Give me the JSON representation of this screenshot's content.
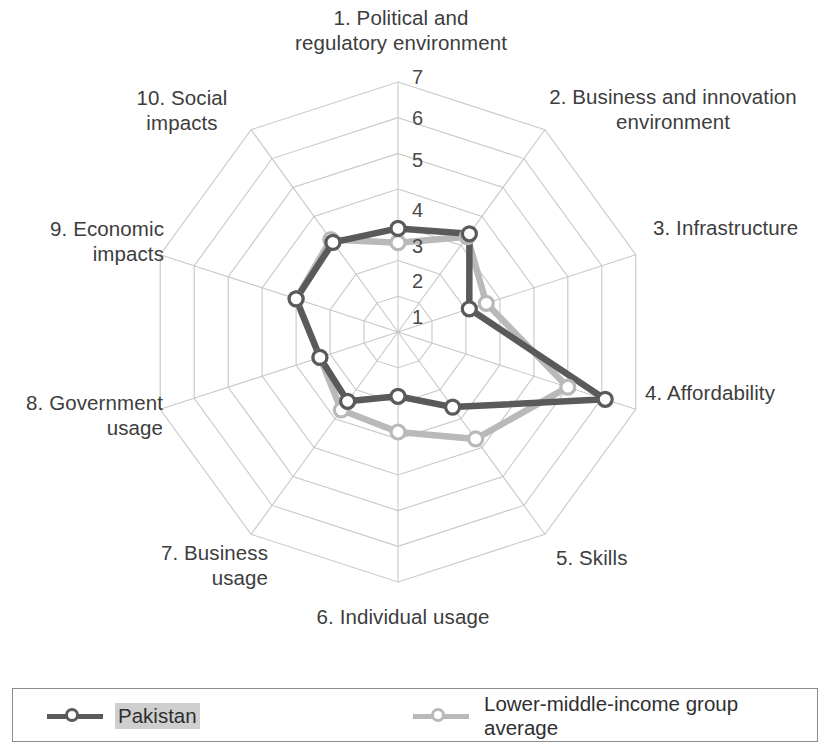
{
  "chart_data": {
    "type": "radar",
    "title": "",
    "categories": [
      "1. Political and regulatory environment",
      "2. Business and innovation environment",
      "3. Infrastructure",
      "4. Affordability",
      "5. Skills",
      "6. Individual usage",
      "7. Business usage",
      "8. Government usage",
      "9. Economic impacts",
      "10. Social impacts"
    ],
    "axis_labels": [
      "1. Political and\nregulatory environment",
      "2. Business and innovation\nenvironment",
      "3. Infrastructure",
      "4. Affordability",
      "5. Skills",
      "6. Individual usage",
      "7. Business\nusage",
      "8. Government\nusage",
      "9. Economic\nimpacts",
      "10. Social\nimpacts"
    ],
    "tick_labels": [
      "1",
      "2",
      "3",
      "4",
      "5",
      "6",
      "7"
    ],
    "ticks": [
      1,
      2,
      3,
      4,
      5,
      6,
      7
    ],
    "rlim": [
      0,
      7
    ],
    "grid": true,
    "grid_shape": "polygon",
    "legend_position": "bottom",
    "series": [
      {
        "name": "Pakistan",
        "color": "#5a5a5a",
        "marker": "circle-open",
        "values": [
          2.9,
          3.4,
          2.1,
          6.1,
          2.6,
          1.8,
          2.4,
          2.3,
          3.0,
          3.1
        ]
      },
      {
        "name": "Lower-middle-income group average",
        "color": "#b9b9b9",
        "marker": "circle-open",
        "values": [
          2.5,
          3.3,
          2.6,
          5.0,
          3.7,
          2.8,
          2.7,
          2.3,
          3.0,
          3.2
        ]
      }
    ]
  },
  "ticks": {
    "t1": "1",
    "t2": "2",
    "t3": "3",
    "t4": "4",
    "t5": "5",
    "t6": "6",
    "t7": "7"
  },
  "axes": {
    "a1": "1. Political and\nregulatory environment",
    "a2": "2. Business and innovation\nenvironment",
    "a3": "3. Infrastructure",
    "a4": "4. Affordability",
    "a5": "5. Skills",
    "a6": "6. Individual usage",
    "a7": "7. Business\nusage",
    "a8": "8. Government\nusage",
    "a9": "9. Economic\nimpacts",
    "a10": "10. Social\nimpacts"
  },
  "legend": {
    "entries": [
      {
        "label": "Pakistan",
        "color": "#5a5a5a",
        "highlighted": true
      },
      {
        "label": "Lower-middle-income group average",
        "color": "#b9b9b9",
        "highlighted": false
      }
    ],
    "label_1": "Pakistan",
    "label_2": "Lower-middle-income group average"
  },
  "colors": {
    "series_primary": "#5a5a5a",
    "series_secondary": "#b9b9b9",
    "grid": "#c8c8c8",
    "text": "#3d3d3d"
  }
}
